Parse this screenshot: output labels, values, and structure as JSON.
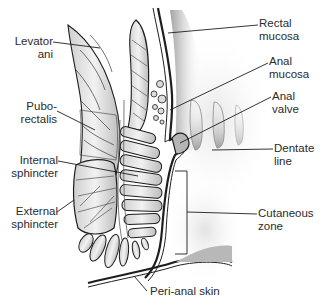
{
  "figure": {
    "type": "anatomical-diagram",
    "colors": {
      "line": "#1e1e1e",
      "label_text": "#2b2b2b",
      "shade_dark": "#9a9a9a",
      "shade_light": "#e3e3e3",
      "background": "#ffffff"
    }
  },
  "labels": {
    "levator_ani": "Levator\nani",
    "puborectalis": "Pubo-\nrectalis",
    "internal_sphincter": "Internal\nsphincter",
    "external_sphincter": "External\nsphincter",
    "rectal_mucosa": "Rectal\nmucosa",
    "anal_mucosa": "Anal\nmucosa",
    "anal_valve": "Anal\nvalve",
    "dentate_line": "Dentate\nline",
    "cutaneous_zone": "Cutaneous\nzone",
    "peri_anal_skin": "Peri-anal skin"
  }
}
